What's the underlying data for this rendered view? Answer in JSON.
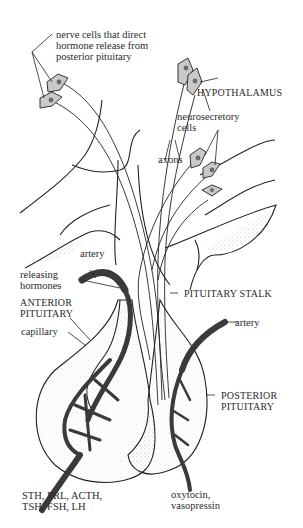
{
  "diagram": {
    "colors": {
      "line": "#222222",
      "vessel": "#3a3a3a",
      "cell_fill": "#c9c9c9",
      "nucleus": "#6b6b6b",
      "stipple": "#777777",
      "background": "#ffffff"
    },
    "labels": {
      "nerve_cells": [
        "nerve cells that direct",
        "hormone release from",
        "posterior pituitary"
      ],
      "hypothalamus": "HYPOTHALAMUS",
      "neurosecretory": [
        "neurosecretory",
        "cells"
      ],
      "axons": "axons",
      "artery_left": "artery",
      "releasing_hormones": [
        "releasing",
        "hormones"
      ],
      "anterior_pituitary": [
        "ANTERIOR",
        "PITUITARY"
      ],
      "capillary": "capillary",
      "pituitary_stalk": "PITUITARY STALK",
      "artery_right": "artery",
      "posterior_pituitary": [
        "POSTERIOR",
        "PITUITARY"
      ],
      "anterior_hormones": [
        "STH, PRL, ACTH,",
        "TSH, FSH, LH"
      ],
      "posterior_hormones": [
        "oxytocin,",
        "vasopressin"
      ]
    }
  }
}
